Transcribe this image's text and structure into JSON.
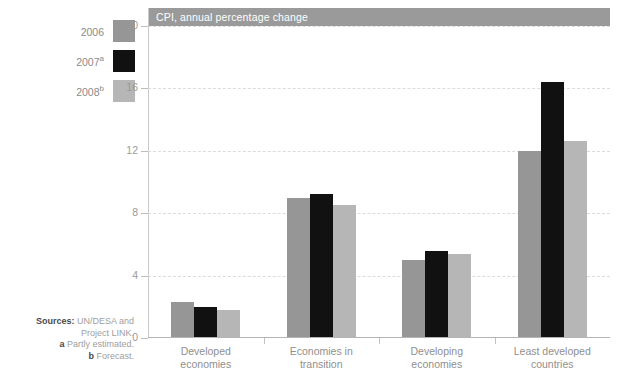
{
  "legend": {
    "items": [
      {
        "label": "2006",
        "sup": "",
        "color": "#969696"
      },
      {
        "label": "2007",
        "sup": "a",
        "color": "#111111"
      },
      {
        "label": "2008",
        "sup": "b",
        "color": "#b6b6b6"
      }
    ]
  },
  "chart": {
    "title": "CPI, annual percentage change"
  },
  "sources": {
    "line1_bold": "Sources:",
    "line1_rest": " UN/DESA and",
    "line2": "Project LINK.",
    "note_a_marker": "a",
    "note_a_text": " Partly estimated.",
    "note_b_marker": "b",
    "note_b_text": " Forecast."
  },
  "chart_data": {
    "type": "bar",
    "title": "CPI, annual percentage change",
    "xlabel": "",
    "ylabel": "",
    "ylim": [
      0,
      20
    ],
    "yticks": [
      0,
      4,
      8,
      12,
      16,
      20
    ],
    "ytick_labels": [
      "0",
      "4",
      "8",
      "12",
      "16",
      "20"
    ],
    "grid": true,
    "legend_position": "left-outside",
    "categories": [
      "Developed economies",
      "Economies in transition",
      "Developing economies",
      "Least developed countries"
    ],
    "category_lines": [
      [
        "Developed",
        "economies"
      ],
      [
        "Economies in",
        "transition"
      ],
      [
        "Developing",
        "economies"
      ],
      [
        "Least developed",
        "countries"
      ]
    ],
    "series": [
      {
        "name": "2006",
        "color": "#969696",
        "values": [
          2.3,
          9.0,
          5.0,
          12.0
        ]
      },
      {
        "name": "2007a",
        "color": "#111111",
        "values": [
          2.0,
          9.2,
          5.6,
          16.4
        ]
      },
      {
        "name": "2008b",
        "color": "#b6b6b6",
        "values": [
          1.8,
          8.5,
          5.4,
          12.6
        ]
      }
    ]
  }
}
